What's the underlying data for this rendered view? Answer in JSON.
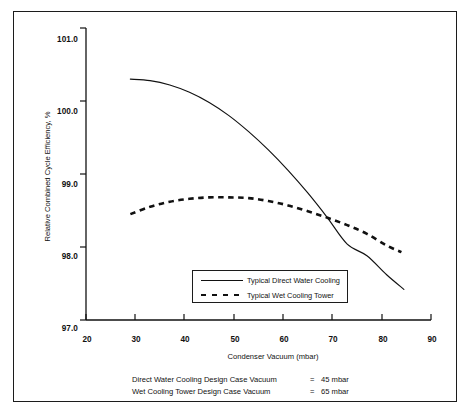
{
  "chart_data": {
    "type": "line",
    "title": "",
    "xlabel": "Condenser Vacuum (mbar)",
    "ylabel": "Relative Combined Cycle Efficiency, %",
    "xlim": [
      20,
      90
    ],
    "ylim": [
      97.0,
      101.0
    ],
    "xticks": [
      "20",
      "30",
      "40",
      "50",
      "60",
      "70",
      "80",
      "90"
    ],
    "yticks": [
      "97.0",
      "98.0",
      "99.0",
      "100.0",
      "101.0"
    ],
    "grid": false,
    "legend_position": "lower-center-inside",
    "series": [
      {
        "name": "Typical Direct Water Cooling",
        "style": "solid",
        "color": "#111111",
        "x": [
          29,
          33,
          37,
          41,
          45,
          49,
          53,
          57,
          61,
          65,
          69,
          73,
          77,
          81,
          84.5
        ],
        "y": [
          100.3,
          100.28,
          100.22,
          100.12,
          99.98,
          99.8,
          99.58,
          99.33,
          99.05,
          98.74,
          98.4,
          98.04,
          97.88,
          97.62,
          97.42
        ]
      },
      {
        "name": "Typical Wet Cooling Tower",
        "style": "dashed",
        "color": "#111111",
        "x": [
          29,
          33,
          37,
          41,
          45,
          49,
          53,
          57,
          61,
          65,
          69,
          73,
          77,
          81,
          84
        ],
        "y": [
          98.45,
          98.55,
          98.62,
          98.66,
          98.68,
          98.68,
          98.67,
          98.63,
          98.57,
          98.49,
          98.4,
          98.3,
          98.18,
          98.02,
          97.93
        ]
      }
    ],
    "annotations": [
      {
        "description": "Direct Water Cooling Design Case Vacuum",
        "equals": "=",
        "value": "45 mbar"
      },
      {
        "description": "Wet Cooling Tower Design Case Vacuum",
        "equals": "=",
        "value": "65 mbar"
      }
    ]
  },
  "axis": {
    "y_title": "Relative Combined Cycle Efficiency, %",
    "x_title": "Condenser Vacuum (mbar)",
    "y_ticks": [
      "101.0",
      "100.0",
      "99.0",
      "98.0",
      "97.0"
    ],
    "x_ticks": [
      "20",
      "30",
      "40",
      "50",
      "60",
      "70",
      "80",
      "90"
    ]
  },
  "legend": {
    "entries": [
      {
        "label": "Typical Direct Water Cooling",
        "style": "solid"
      },
      {
        "label": "Typical Wet Cooling Tower",
        "style": "dashed"
      }
    ]
  },
  "footnote": {
    "rows": [
      {
        "desc": "Direct Water Cooling Design Case Vacuum",
        "eq": "=",
        "val": "45 mbar"
      },
      {
        "desc": "Wet Cooling Tower Design Case Vacuum",
        "eq": "=",
        "val": "65 mbar"
      }
    ]
  }
}
